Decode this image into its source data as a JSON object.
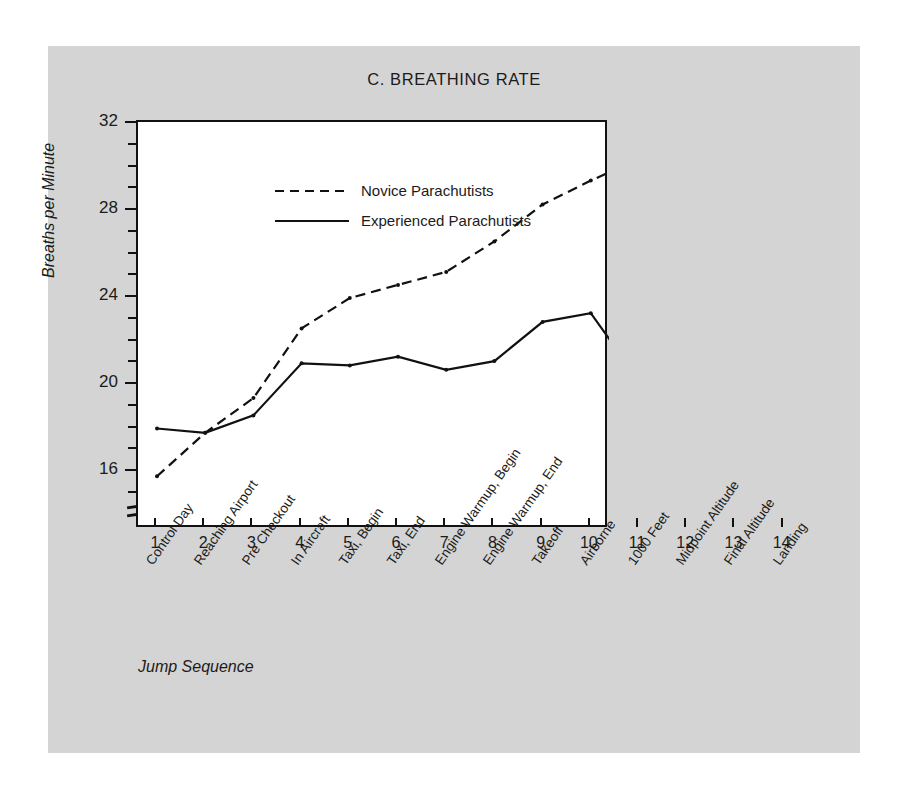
{
  "figure": {
    "title": "C. BREATHING RATE",
    "xaxis_title": "Jump Sequence",
    "yaxis_title": "Breaths per Minute"
  },
  "legend": {
    "items": [
      {
        "label": "Novice Parachutists",
        "style": "dashed"
      },
      {
        "label": "Experienced Parachutists",
        "style": "solid"
      }
    ]
  },
  "chart_data": {
    "type": "line",
    "title": "C. BREATHING RATE",
    "xlabel": "Jump Sequence",
    "ylabel": "Breaths per Minute",
    "ylim": [
      14,
      32
    ],
    "yticks": [
      16,
      20,
      24,
      28,
      32
    ],
    "yminor_step": 1,
    "grid": false,
    "legend_position": "top-left inside",
    "axis_break_y": true,
    "annotations": [
      {
        "type": "vertical-dashed-line",
        "x": 13,
        "label": "Final Altitude marker"
      }
    ],
    "x": [
      1,
      2,
      3,
      4,
      5,
      6,
      7,
      8,
      9,
      10,
      11,
      12,
      13,
      14
    ],
    "categories": [
      "Control Day",
      "Reaching Airport",
      "Pre Checkout",
      "In Aircraft",
      "Taxi, Begin",
      "Taxi, End",
      "Engine Warmup, Begin",
      "Engine Warmup, End",
      "Takeoff",
      "Airborne",
      "1000 Feet",
      "Midpoint Altitude",
      "Final Altitude",
      "Landing"
    ],
    "series": [
      {
        "name": "Novice Parachutists",
        "style": "dashed",
        "color": "#111111",
        "values": [
          15.8,
          17.8,
          19.4,
          22.6,
          24.0,
          24.6,
          25.2,
          26.6,
          28.3,
          29.4,
          30.4,
          29.8,
          31.4,
          21.2
        ]
      },
      {
        "name": "Experienced Parachutists",
        "style": "solid",
        "color": "#111111",
        "values": [
          18.0,
          17.8,
          18.6,
          21.0,
          20.9,
          21.3,
          20.7,
          21.1,
          22.9,
          23.3,
          20.2,
          19.6,
          18.7,
          21.2
        ]
      }
    ]
  }
}
